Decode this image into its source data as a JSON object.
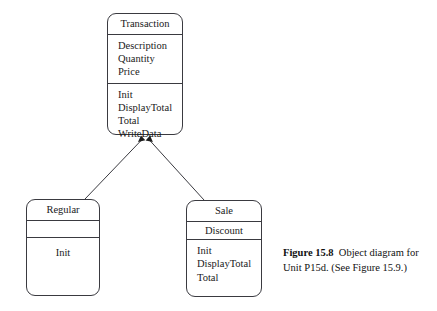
{
  "diagram": {
    "type": "uml-object-diagram",
    "classes": [
      {
        "id": "transaction",
        "name": "Transaction",
        "attributes": [
          "Description",
          "Quantity",
          "Price"
        ],
        "operations": [
          "Init",
          "DisplayTotal",
          "Total",
          "WriteData"
        ]
      },
      {
        "id": "regular",
        "name": "Regular",
        "attributes": [],
        "operations": [
          "Init"
        ]
      },
      {
        "id": "sale",
        "name": "Sale",
        "attributes": [
          "Discount"
        ],
        "operations": [
          "Init",
          "DisplayTotal",
          "Total"
        ]
      }
    ],
    "relationships": [
      {
        "type": "inheritance",
        "from": "regular",
        "to": "transaction"
      },
      {
        "type": "inheritance",
        "from": "sale",
        "to": "transaction"
      }
    ],
    "colors": {
      "stroke": "#3a3a40",
      "background": "#ffffff",
      "text": "#1a1a1a"
    }
  },
  "caption": {
    "figure_number": "Figure 15.8",
    "text": "Object diagram for Unit P15d. (See Figure 15.9.)"
  },
  "text_blocks": {
    "tx_attrs": "Description\nQuantity\nPrice",
    "tx_ops": "Init\nDisplayTotal\nTotal\nWriteData",
    "regular_ops": "Init",
    "sale_attrs": "Discount",
    "sale_ops": "Init\nDisplayTotal\nTotal"
  }
}
